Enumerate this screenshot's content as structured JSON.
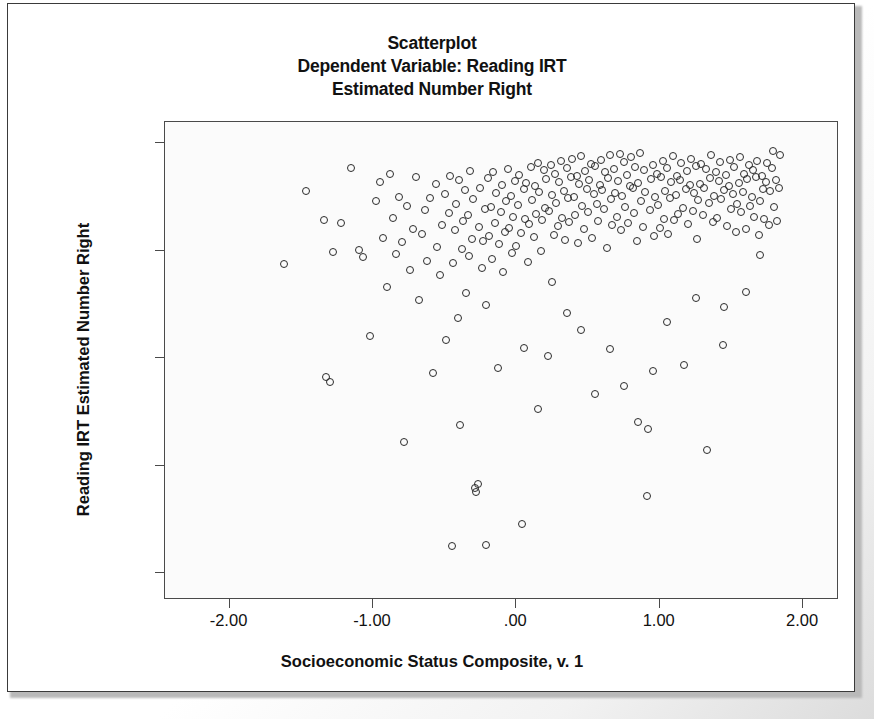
{
  "chart_data": {
    "type": "scatter",
    "title": "Scatterplot",
    "subtitle_lines": [
      "Scatterplot",
      "Dependent Variable: Reading IRT",
      "Estimated Number Right"
    ],
    "xlabel": "Socioeconomic Status Composite, v. 1",
    "ylabel": "Reading IRT Estimated Number Right",
    "xlim": [
      -2.45,
      2.25
    ],
    "ylim": [
      7.5,
      52.0
    ],
    "xticks": [
      -2.0,
      -1.0,
      0.0,
      1.0,
      2.0
    ],
    "xticklabels": [
      "-2.00",
      "-1.00",
      ".00",
      "1.00",
      "2.00"
    ],
    "yticks": [
      10,
      20,
      30,
      40,
      50
    ],
    "yticklabels": [
      "10.000",
      "20.000",
      "30.000",
      "40.000",
      "50.000"
    ],
    "grid": false,
    "legend": "none",
    "marker": "open-circle",
    "marker_color": "#2b2b2b",
    "n_points": 612,
    "points": [
      [
        -1.62,
        38.8
      ],
      [
        -1.47,
        45.6
      ],
      [
        -1.34,
        42.9
      ],
      [
        -1.33,
        28.3
      ],
      [
        -1.3,
        27.8
      ],
      [
        -1.28,
        39.9
      ],
      [
        -1.22,
        42.6
      ],
      [
        -1.15,
        47.7
      ],
      [
        -1.1,
        40.1
      ],
      [
        -1.07,
        39.4
      ],
      [
        -1.02,
        32.1
      ],
      [
        -0.98,
        44.6
      ],
      [
        -0.95,
        46.4
      ],
      [
        -0.93,
        41.2
      ],
      [
        -0.9,
        36.6
      ],
      [
        -0.88,
        47.2
      ],
      [
        -0.86,
        43.1
      ],
      [
        -0.84,
        39.7
      ],
      [
        -0.82,
        45.0
      ],
      [
        -0.8,
        40.8
      ],
      [
        -0.78,
        22.2
      ],
      [
        -0.76,
        44.2
      ],
      [
        -0.74,
        38.2
      ],
      [
        -0.72,
        42.0
      ],
      [
        -0.7,
        46.9
      ],
      [
        -0.68,
        35.4
      ],
      [
        -0.66,
        41.6
      ],
      [
        -0.64,
        43.8
      ],
      [
        -0.62,
        39.1
      ],
      [
        -0.6,
        44.9
      ],
      [
        -0.58,
        28.6
      ],
      [
        -0.56,
        46.2
      ],
      [
        -0.55,
        40.4
      ],
      [
        -0.53,
        37.8
      ],
      [
        -0.52,
        42.4
      ],
      [
        -0.5,
        45.3
      ],
      [
        -0.49,
        31.7
      ],
      [
        -0.47,
        43.5
      ],
      [
        -0.46,
        47.0
      ],
      [
        -0.45,
        12.5
      ],
      [
        -0.44,
        38.9
      ],
      [
        -0.43,
        41.9
      ],
      [
        -0.42,
        44.4
      ],
      [
        -0.41,
        33.8
      ],
      [
        -0.4,
        46.6
      ],
      [
        -0.39,
        23.8
      ],
      [
        -0.38,
        40.2
      ],
      [
        -0.37,
        42.8
      ],
      [
        -0.36,
        45.7
      ],
      [
        -0.35,
        36.1
      ],
      [
        -0.34,
        43.3
      ],
      [
        -0.33,
        39.5
      ],
      [
        -0.32,
        47.4
      ],
      [
        -0.31,
        41.1
      ],
      [
        -0.3,
        44.8
      ],
      [
        -0.29,
        17.9
      ],
      [
        -0.28,
        17.6
      ],
      [
        -0.27,
        18.3
      ],
      [
        -0.26,
        42.2
      ],
      [
        -0.25,
        45.9
      ],
      [
        -0.24,
        38.4
      ],
      [
        -0.23,
        40.9
      ],
      [
        -0.22,
        43.9
      ],
      [
        -0.21,
        35.0
      ],
      [
        -0.21,
        12.6
      ],
      [
        -0.2,
        46.8
      ],
      [
        -0.19,
        41.4
      ],
      [
        -0.18,
        44.1
      ],
      [
        -0.17,
        39.2
      ],
      [
        -0.16,
        47.3
      ],
      [
        -0.15,
        42.6
      ],
      [
        -0.14,
        45.4
      ],
      [
        -0.13,
        29.1
      ],
      [
        -0.12,
        40.6
      ],
      [
        -0.11,
        43.6
      ],
      [
        -0.1,
        46.1
      ],
      [
        -0.09,
        38.0
      ],
      [
        -0.08,
        41.8
      ],
      [
        -0.07,
        44.6
      ],
      [
        -0.06,
        47.6
      ],
      [
        -0.05,
        42.1
      ],
      [
        -0.04,
        45.1
      ],
      [
        -0.03,
        39.8
      ],
      [
        -0.02,
        43.2
      ],
      [
        -0.01,
        46.5
      ],
      [
        0.0,
        40.5
      ],
      [
        0.01,
        44.3
      ],
      [
        0.02,
        47.1
      ],
      [
        0.03,
        41.7
      ],
      [
        0.04,
        14.6
      ],
      [
        0.05,
        45.8
      ],
      [
        0.06,
        43.0
      ],
      [
        0.07,
        46.3
      ],
      [
        0.08,
        39.0
      ],
      [
        0.09,
        42.5
      ],
      [
        0.1,
        47.8
      ],
      [
        0.11,
        44.7
      ],
      [
        0.12,
        41.3
      ],
      [
        0.13,
        46.0
      ],
      [
        0.14,
        43.4
      ],
      [
        0.15,
        48.2
      ],
      [
        0.16,
        45.5
      ],
      [
        0.17,
        40.0
      ],
      [
        0.18,
        42.9
      ],
      [
        0.19,
        47.5
      ],
      [
        0.2,
        44.0
      ],
      [
        0.21,
        46.7
      ],
      [
        0.22,
        30.2
      ],
      [
        0.23,
        43.7
      ],
      [
        0.24,
        48.0
      ],
      [
        0.25,
        45.2
      ],
      [
        0.26,
        41.5
      ],
      [
        0.27,
        47.2
      ],
      [
        0.28,
        44.5
      ],
      [
        0.29,
        42.3
      ],
      [
        0.3,
        46.4
      ],
      [
        0.31,
        48.4
      ],
      [
        0.32,
        43.1
      ],
      [
        0.33,
        45.6
      ],
      [
        0.34,
        41.0
      ],
      [
        0.35,
        47.7
      ],
      [
        0.36,
        44.9
      ],
      [
        0.37,
        42.7
      ],
      [
        0.38,
        46.9
      ],
      [
        0.39,
        48.6
      ],
      [
        0.4,
        45.0
      ],
      [
        0.41,
        43.3
      ],
      [
        0.42,
        47.0
      ],
      [
        0.43,
        40.7
      ],
      [
        0.44,
        46.2
      ],
      [
        0.45,
        48.8
      ],
      [
        0.46,
        44.2
      ],
      [
        0.47,
        42.0
      ],
      [
        0.48,
        47.4
      ],
      [
        0.49,
        45.8
      ],
      [
        0.5,
        43.6
      ],
      [
        0.51,
        46.6
      ],
      [
        0.52,
        48.1
      ],
      [
        0.53,
        41.2
      ],
      [
        0.54,
        45.3
      ],
      [
        0.55,
        47.9
      ],
      [
        0.56,
        44.4
      ],
      [
        0.57,
        42.8
      ],
      [
        0.58,
        46.1
      ],
      [
        0.59,
        48.5
      ],
      [
        0.6,
        45.7
      ],
      [
        0.61,
        43.9
      ],
      [
        0.62,
        47.3
      ],
      [
        0.63,
        40.3
      ],
      [
        0.64,
        46.8
      ],
      [
        0.65,
        48.9
      ],
      [
        0.66,
        44.8
      ],
      [
        0.67,
        42.4
      ],
      [
        0.68,
        47.6
      ],
      [
        0.69,
        45.4
      ],
      [
        0.7,
        43.2
      ],
      [
        0.71,
        46.5
      ],
      [
        0.72,
        49.0
      ],
      [
        0.73,
        41.9
      ],
      [
        0.74,
        45.1
      ],
      [
        0.75,
        48.3
      ],
      [
        0.76,
        44.1
      ],
      [
        0.77,
        47.1
      ],
      [
        0.78,
        42.6
      ],
      [
        0.79,
        46.0
      ],
      [
        0.8,
        48.7
      ],
      [
        0.81,
        45.9
      ],
      [
        0.82,
        43.5
      ],
      [
        0.83,
        47.8
      ],
      [
        0.84,
        40.9
      ],
      [
        0.85,
        46.3
      ],
      [
        0.86,
        49.1
      ],
      [
        0.87,
        44.6
      ],
      [
        0.88,
        42.2
      ],
      [
        0.89,
        47.5
      ],
      [
        0.9,
        45.5
      ],
      [
        0.91,
        17.2
      ],
      [
        0.92,
        23.4
      ],
      [
        0.93,
        43.8
      ],
      [
        0.94,
        46.7
      ],
      [
        0.95,
        48.0
      ],
      [
        0.96,
        41.4
      ],
      [
        0.97,
        45.0
      ],
      [
        0.98,
        47.2
      ],
      [
        0.99,
        44.3
      ],
      [
        1.0,
        42.1
      ],
      [
        1.01,
        46.9
      ],
      [
        1.02,
        48.4
      ],
      [
        1.03,
        43.0
      ],
      [
        1.04,
        45.6
      ],
      [
        1.05,
        47.7
      ],
      [
        1.06,
        41.6
      ],
      [
        1.07,
        44.9
      ],
      [
        1.08,
        46.4
      ],
      [
        1.09,
        48.8
      ],
      [
        1.1,
        42.9
      ],
      [
        1.11,
        45.2
      ],
      [
        1.12,
        47.0
      ],
      [
        1.13,
        43.4
      ],
      [
        1.14,
        46.6
      ],
      [
        1.15,
        48.2
      ],
      [
        1.16,
        44.0
      ],
      [
        1.17,
        29.4
      ],
      [
        1.18,
        45.8
      ],
      [
        1.19,
        47.4
      ],
      [
        1.2,
        42.5
      ],
      [
        1.21,
        46.1
      ],
      [
        1.22,
        48.6
      ],
      [
        1.23,
        43.7
      ],
      [
        1.24,
        45.4
      ],
      [
        1.25,
        47.9
      ],
      [
        1.26,
        41.1
      ],
      [
        1.27,
        44.7
      ],
      [
        1.28,
        46.2
      ],
      [
        1.29,
        48.1
      ],
      [
        1.3,
        43.3
      ],
      [
        1.31,
        45.9
      ],
      [
        1.32,
        47.6
      ],
      [
        1.33,
        21.5
      ],
      [
        1.34,
        44.5
      ],
      [
        1.35,
        46.8
      ],
      [
        1.36,
        48.9
      ],
      [
        1.37,
        42.7
      ],
      [
        1.38,
        45.1
      ],
      [
        1.39,
        47.3
      ],
      [
        1.4,
        43.1
      ],
      [
        1.41,
        46.5
      ],
      [
        1.42,
        48.3
      ],
      [
        1.43,
        44.8
      ],
      [
        1.44,
        31.2
      ],
      [
        1.45,
        45.7
      ],
      [
        1.46,
        47.1
      ],
      [
        1.47,
        42.3
      ],
      [
        1.48,
        46.0
      ],
      [
        1.49,
        48.5
      ],
      [
        1.5,
        43.9
      ],
      [
        1.51,
        45.3
      ],
      [
        1.52,
        47.8
      ],
      [
        1.53,
        41.8
      ],
      [
        1.54,
        44.4
      ],
      [
        1.55,
        46.3
      ],
      [
        1.56,
        48.7
      ],
      [
        1.57,
        43.6
      ],
      [
        1.58,
        45.5
      ],
      [
        1.59,
        47.2
      ],
      [
        1.6,
        42.0
      ],
      [
        1.61,
        46.7
      ],
      [
        1.62,
        48.0
      ],
      [
        1.63,
        44.2
      ],
      [
        1.64,
        45.0
      ],
      [
        1.65,
        47.5
      ],
      [
        1.66,
        43.2
      ],
      [
        1.67,
        46.9
      ],
      [
        1.68,
        48.4
      ],
      [
        1.69,
        41.5
      ],
      [
        1.7,
        44.6
      ],
      [
        1.71,
        47.0
      ],
      [
        1.72,
        45.8
      ],
      [
        1.73,
        43.0
      ],
      [
        1.74,
        46.4
      ],
      [
        1.75,
        48.2
      ],
      [
        1.76,
        42.4
      ],
      [
        1.77,
        45.6
      ],
      [
        1.78,
        47.7
      ],
      [
        1.79,
        49.3
      ],
      [
        1.8,
        44.1
      ],
      [
        1.81,
        46.6
      ],
      [
        1.82,
        42.8
      ],
      [
        1.83,
        45.9
      ],
      [
        1.84,
        48.9
      ],
      [
        1.6,
        36.2
      ],
      [
        1.7,
        39.6
      ],
      [
        1.45,
        34.8
      ],
      [
        1.25,
        35.6
      ],
      [
        1.05,
        33.4
      ],
      [
        0.95,
        28.8
      ],
      [
        0.85,
        24.1
      ],
      [
        0.75,
        27.4
      ],
      [
        0.65,
        30.9
      ],
      [
        0.55,
        26.7
      ],
      [
        0.45,
        32.6
      ],
      [
        0.35,
        34.2
      ],
      [
        0.25,
        37.1
      ],
      [
        0.15,
        25.3
      ],
      [
        0.05,
        31.0
      ]
    ]
  }
}
